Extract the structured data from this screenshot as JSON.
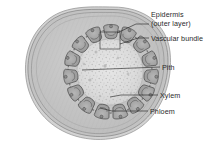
{
  "figure": {
    "background_color": "#ffffff"
  },
  "labels": [
    {
      "name": "epidermis",
      "line1": "Epidermis",
      "line2": "(outer layer)",
      "text_x": 151,
      "text_y": 17,
      "leader": "M 149 24 L 136 24 L 117 33",
      "color": "#2b2b2b"
    },
    {
      "name": "vascular-bundle",
      "line1": "Vascular bundle",
      "line2": "",
      "text_x": 151,
      "text_y": 41,
      "leader": "M 149 38 L 138 38 L 120 44",
      "color": "#2b2b2b"
    },
    {
      "name": "pith",
      "line1": "Pith",
      "line2": "",
      "text_x": 162,
      "text_y": 70,
      "leader": "M 160 67 L 82 70",
      "color": "#2b2b2b"
    },
    {
      "name": "xylem",
      "line1": "Xylem",
      "line2": "",
      "text_x": 160,
      "text_y": 98,
      "leader": "M 158 95 L 121 95 L 110 97",
      "color": "#2b2b2b"
    },
    {
      "name": "phloem",
      "line1": "Phloem",
      "line2": "",
      "text_x": 150,
      "text_y": 114,
      "leader": "M 148 111 L 112 111 L 100 108",
      "color": "#2b2b2b"
    }
  ],
  "callout": {
    "name": "vascular-bundle-highlight",
    "x": 100,
    "y": 32,
    "width": 20,
    "height": 17
  },
  "anatomy": {
    "epidermis_outer_color": "#b9b9b9",
    "epidermis_inner_color": "#cfcfcf",
    "cortex_color": "#c6c6c6",
    "pith_color": "#dedede",
    "bundle_fill": "#a9a9a9",
    "bundle_stroke": "#575757",
    "cambium_color": "#7d7d7d",
    "outline_color": "#6f6f6f",
    "bundle_count": 15,
    "structure_notes": "irregular rounded stem outline with concentric epidermis and cortex layers, a ring of 15 vascular bundles connected by a dark cambium band, and a speckled central pith"
  }
}
